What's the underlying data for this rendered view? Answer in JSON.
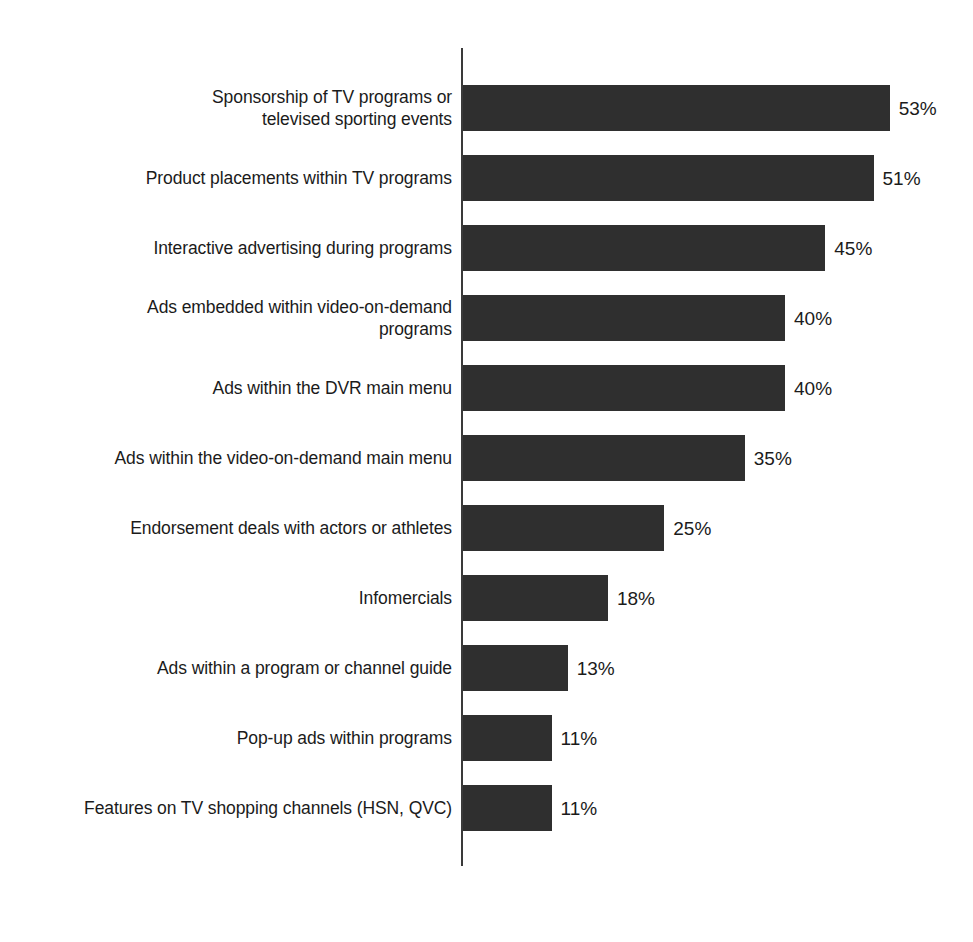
{
  "chart_data": {
    "type": "bar",
    "orientation": "horizontal",
    "title": "",
    "subtitle": "",
    "xlabel": "",
    "ylabel": "",
    "xlim": [
      0,
      60
    ],
    "grid": false,
    "legend": false,
    "value_suffix": "%",
    "bar_color": "#2f2f2f",
    "axis_color": "#3a3a3a",
    "background_color": "#ffffff",
    "text_color": "#1b1b1b",
    "categories": [
      "Sponsorship of TV programs or\ntelevised sporting events",
      "Product placements within TV programs",
      "Interactive advertising during programs",
      "Ads embedded within video-on-demand\nprograms",
      "Ads within the DVR main menu",
      "Ads within the video-on-demand main menu",
      "Endorsement deals with actors or athletes",
      "Infomercials",
      "Ads within a program or channel guide",
      "Pop-up ads within programs",
      "Features on TV shopping channels (HSN, QVC)"
    ],
    "values": [
      53,
      51,
      45,
      40,
      40,
      35,
      25,
      18,
      13,
      11,
      11
    ],
    "value_labels": [
      "53%",
      "51%",
      "45%",
      "40%",
      "40%",
      "35%",
      "25%",
      "18%",
      "13%",
      "11%",
      "11%"
    ],
    "bars": [
      {
        "label": "Sponsorship of TV programs or\ntelevised sporting events",
        "value": 53,
        "value_label": "53%"
      },
      {
        "label": "Product placements within TV programs",
        "value": 51,
        "value_label": "51%"
      },
      {
        "label": "Interactive advertising during programs",
        "value": 45,
        "value_label": "45%"
      },
      {
        "label": "Ads embedded within video-on-demand\nprograms",
        "value": 40,
        "value_label": "40%"
      },
      {
        "label": "Ads within the DVR main menu",
        "value": 40,
        "value_label": "40%"
      },
      {
        "label": "Ads within the video-on-demand main menu",
        "value": 35,
        "value_label": "35%"
      },
      {
        "label": "Endorsement deals with actors or athletes",
        "value": 25,
        "value_label": "25%"
      },
      {
        "label": "Infomercials",
        "value": 18,
        "value_label": "18%"
      },
      {
        "label": "Ads within a program or channel guide",
        "value": 13,
        "value_label": "13%"
      },
      {
        "label": "Pop-up ads within programs",
        "value": 11,
        "value_label": "11%"
      },
      {
        "label": "Features on TV shopping channels (HSN, QVC)",
        "value": 11,
        "value_label": "11%"
      }
    ]
  },
  "layout": {
    "first_bar_top": 85,
    "bar_height": 46,
    "row_pitch": 70,
    "axis_left": 461,
    "px_per_unit": 8.05,
    "value_gap": 9
  }
}
